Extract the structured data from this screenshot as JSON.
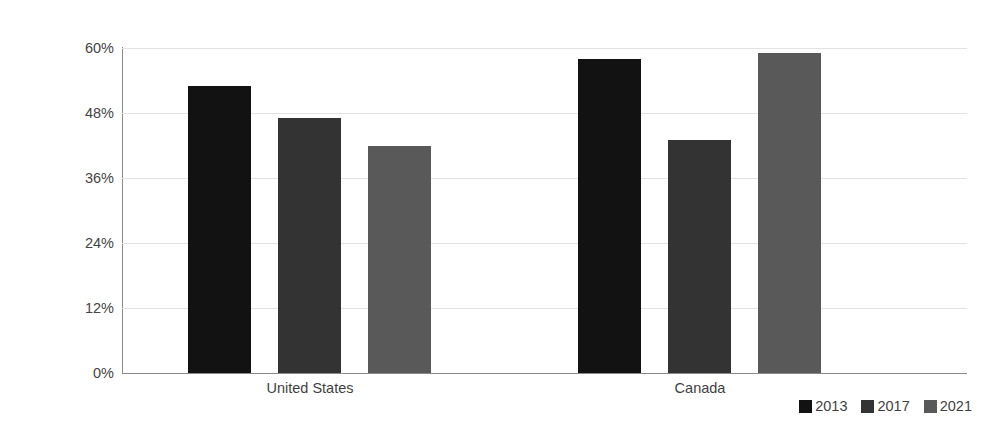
{
  "chart_data": {
    "type": "bar",
    "title": "",
    "subtitle": "",
    "xlabel": "",
    "ylabel": "Percentage of general population",
    "categories": [
      "United States",
      "Canada"
    ],
    "series": [
      {
        "name": "2013",
        "values": [
          53,
          58
        ],
        "color": "#121212"
      },
      {
        "name": "2017",
        "values": [
          47,
          43
        ],
        "color": "#333333"
      },
      {
        "name": "2021",
        "values": [
          42,
          59
        ],
        "color": "#595959"
      }
    ],
    "ylim": [
      0,
      60
    ],
    "yticks": [
      0,
      12,
      24,
      36,
      48,
      60
    ],
    "ytick_labels": [
      "0%",
      "12%",
      "24%",
      "36%",
      "48%",
      "60%"
    ],
    "grid": true,
    "grid_axis": "y",
    "legend_position": "bottom-right",
    "legend_entries": [
      "2013",
      "2017",
      "2021"
    ]
  },
  "axes": {
    "y_title": "Percentage of general population",
    "y_ticks": [
      {
        "label": "60%",
        "value": 60
      },
      {
        "label": "48%",
        "value": 48
      },
      {
        "label": "36%",
        "value": 36
      },
      {
        "label": "24%",
        "value": 24
      },
      {
        "label": "12%",
        "value": 12
      },
      {
        "label": "0%",
        "value": 0
      }
    ],
    "x_categories": [
      {
        "label": "United States"
      },
      {
        "label": "Canada"
      }
    ]
  },
  "legend": {
    "items": [
      {
        "label": "2013",
        "color": "#121212"
      },
      {
        "label": "2017",
        "color": "#333333"
      },
      {
        "label": "2021",
        "color": "#595959"
      }
    ]
  },
  "colors": {
    "series_2013": "#121212",
    "series_2017": "#333333",
    "series_2021": "#595959",
    "gridline": "#e2e2e2",
    "axis": "#8a8a8a",
    "text": "#3f3f3f",
    "background": "#ffffff"
  }
}
